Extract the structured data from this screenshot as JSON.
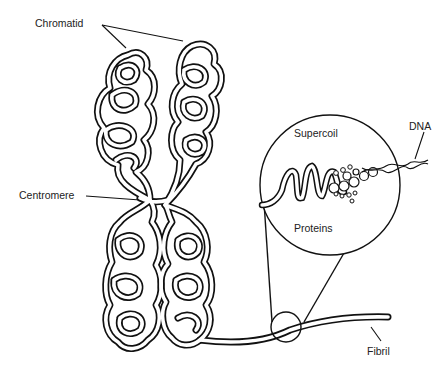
{
  "diagram": {
    "labels": {
      "chromatid": "Chromatid",
      "centromere": "Centromere",
      "supercoil": "Supercoil",
      "dna": "DNA",
      "proteins": "Proteins",
      "fibril": "Fibril"
    },
    "colors": {
      "stroke": "#111111",
      "background": "#ffffff",
      "text": "#222222"
    }
  }
}
